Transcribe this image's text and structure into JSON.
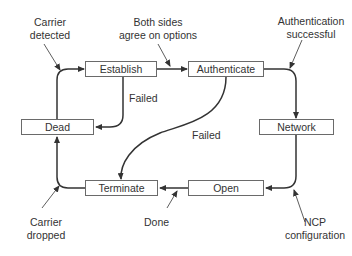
{
  "diagram": {
    "states": {
      "establish": "Establish",
      "authenticate": "Authenticate",
      "dead": "Dead",
      "network": "Network",
      "terminate": "Terminate",
      "open": "Open"
    },
    "annotations": {
      "carrier_detected_1": "Carrier",
      "carrier_detected_2": "detected",
      "both_sides_1": "Both sides",
      "both_sides_2": "agree on options",
      "auth_success_1": "Authentication",
      "auth_success_2": "successful",
      "failed_establish": "Failed",
      "failed_authenticate": "Failed",
      "carrier_dropped_1": "Carrier",
      "carrier_dropped_2": "dropped",
      "done": "Done",
      "ncp_1": "NCP",
      "ncp_2": "configuration"
    },
    "transitions": [
      {
        "from": "Dead",
        "to": "Establish",
        "label": "Carrier detected"
      },
      {
        "from": "Establish",
        "to": "Authenticate",
        "label": "Both sides agree on options"
      },
      {
        "from": "Establish",
        "to": "Dead",
        "label": "Failed"
      },
      {
        "from": "Authenticate",
        "to": "Network",
        "label": "Authentication successful"
      },
      {
        "from": "Authenticate",
        "to": "Terminate",
        "label": "Failed"
      },
      {
        "from": "Network",
        "to": "Open",
        "label": "NCP configuration"
      },
      {
        "from": "Open",
        "to": "Terminate",
        "label": "Done"
      },
      {
        "from": "Terminate",
        "to": "Dead",
        "label": "Carrier dropped"
      }
    ]
  }
}
